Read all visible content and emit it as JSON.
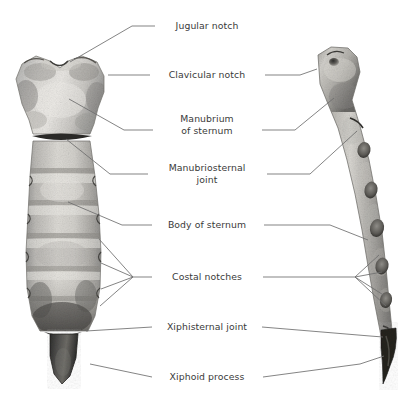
{
  "figure": {
    "background_color": "#ffffff",
    "text_color": "#3a3a3a",
    "leader_line_color": "#6e6e6e",
    "views": [
      {
        "name": "anterior-view-sternum",
        "position": "left"
      },
      {
        "name": "lateral-view-sternum",
        "position": "right"
      }
    ]
  },
  "labels": [
    {
      "id": "jugular-notch",
      "text": "Jugular notch",
      "x": 207,
      "y": 26
    },
    {
      "id": "clavicular-notch",
      "text": "Clavicular notch",
      "x": 207,
      "y": 75
    },
    {
      "id": "manubrium-of-sternum",
      "text": "Manubrium\nof sternum",
      "x": 207,
      "y": 125
    },
    {
      "id": "manubriosternal-joint",
      "text": "Manubriosternal\njoint",
      "x": 207,
      "y": 174
    },
    {
      "id": "body-of-sternum",
      "text": "Body of sternum",
      "x": 207,
      "y": 225
    },
    {
      "id": "costal-notches",
      "text": "Costal notches",
      "x": 207,
      "y": 277
    },
    {
      "id": "xiphisternal-joint",
      "text": "Xiphisternal joint",
      "x": 207,
      "y": 327
    },
    {
      "id": "xiphoid-process",
      "text": "Xiphoid process",
      "x": 207,
      "y": 377
    }
  ]
}
